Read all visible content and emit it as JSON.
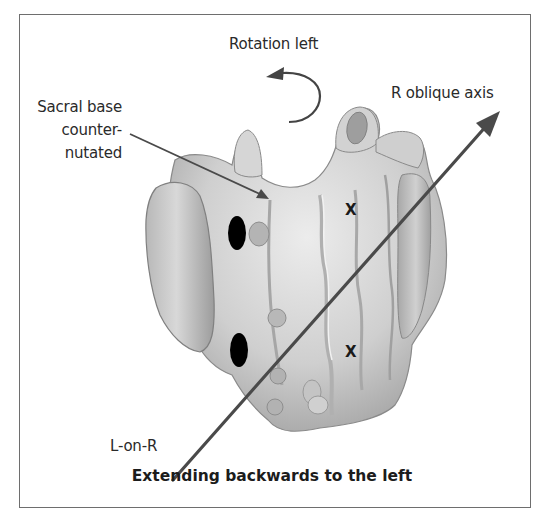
{
  "figure": {
    "title_label": "Rotation left",
    "axis_label": "R oblique axis",
    "callout": {
      "line1": "Sacral base",
      "line2": "counter-",
      "line3": "nutated"
    },
    "axis_end_label": "L-on-R",
    "caption": "Extending backwards to the left",
    "markers": {
      "x_upper": "X",
      "x_lower": "X"
    },
    "colors": {
      "bone_light": "#e6e6e6",
      "bone_mid": "#bdbdbd",
      "bone_dark": "#8a8a8a",
      "axis_line": "#4a4a4a",
      "oval": "#000000",
      "frame": "#6e6e6e"
    }
  }
}
